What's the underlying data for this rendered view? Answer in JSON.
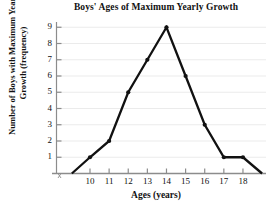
{
  "chart_data": {
    "type": "line",
    "title": "Boys' Ages of Maximum Yearly Growth",
    "xlabel": "Ages (years)",
    "ylabel": "Number of Boys with Maximum Yearly Growth (frequency)",
    "x": [
      9.05,
      10,
      11,
      12,
      13,
      14,
      15,
      16,
      17,
      18,
      19
    ],
    "values": [
      0,
      1,
      2,
      5,
      7,
      9,
      6,
      3,
      1,
      1,
      0
    ],
    "points": [
      {
        "x": 10,
        "y": 1
      },
      {
        "x": 11,
        "y": 2
      },
      {
        "x": 12,
        "y": 5
      },
      {
        "x": 13,
        "y": 7
      },
      {
        "x": 14,
        "y": 9
      },
      {
        "x": 15,
        "y": 6
      },
      {
        "x": 16,
        "y": 3
      },
      {
        "x": 17,
        "y": 1
      },
      {
        "x": 18,
        "y": 1
      }
    ],
    "xticks": [
      10,
      11,
      12,
      13,
      14,
      15,
      16,
      17,
      18
    ],
    "xtick_labels": [
      "10",
      "11",
      "12",
      "13",
      "14",
      "15",
      "16",
      "17",
      "18"
    ],
    "yticks": [
      1,
      2,
      3,
      4,
      5,
      6,
      7,
      8,
      9
    ],
    "ytick_labels": [
      "1",
      "2",
      "3",
      "4",
      "5",
      "6",
      "7",
      "8",
      "9"
    ],
    "xlim": [
      9.05,
      19
    ],
    "ylim": [
      0,
      9.5
    ],
    "grid": true,
    "grid_axis": "y",
    "legend": null,
    "series_color": "#111111",
    "grid_color": "#ebebeb",
    "axis_color": "#8c8c8c",
    "marker": "filled-circle"
  }
}
